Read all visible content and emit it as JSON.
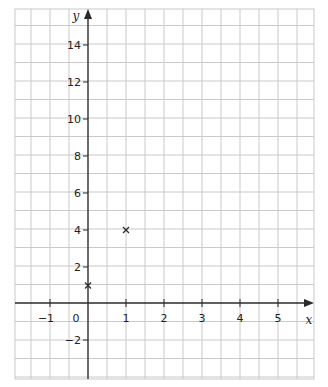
{
  "chart_data": {
    "type": "scatter",
    "title": "",
    "xlabel": "x",
    "ylabel": "y",
    "xlim": [
      -2,
      6
    ],
    "ylim": [
      -4,
      15.5
    ],
    "grid": true,
    "x_ticks": [
      "-1",
      "0",
      "1",
      "2",
      "3",
      "4",
      "5"
    ],
    "y_ticks": [
      "-2",
      "2",
      "4",
      "6",
      "8",
      "10",
      "12",
      "14"
    ],
    "series": [
      {
        "name": "points",
        "marker": "x",
        "points": [
          [
            0,
            1
          ],
          [
            1,
            4
          ]
        ]
      }
    ]
  },
  "labels": {
    "x_axis": "x",
    "y_axis": "y",
    "xt": {
      "m1": "−1",
      "z": "0",
      "p1": "1",
      "p2": "2",
      "p3": "3",
      "p4": "4",
      "p5": "5"
    },
    "yt": {
      "m2": "−2",
      "p2": "2",
      "p4": "4",
      "p6": "6",
      "p8": "8",
      "p10": "10",
      "p12": "12",
      "p14": "14"
    }
  },
  "colors": {
    "grid": "#c8c8c8",
    "axis": "#2a2a2a"
  }
}
